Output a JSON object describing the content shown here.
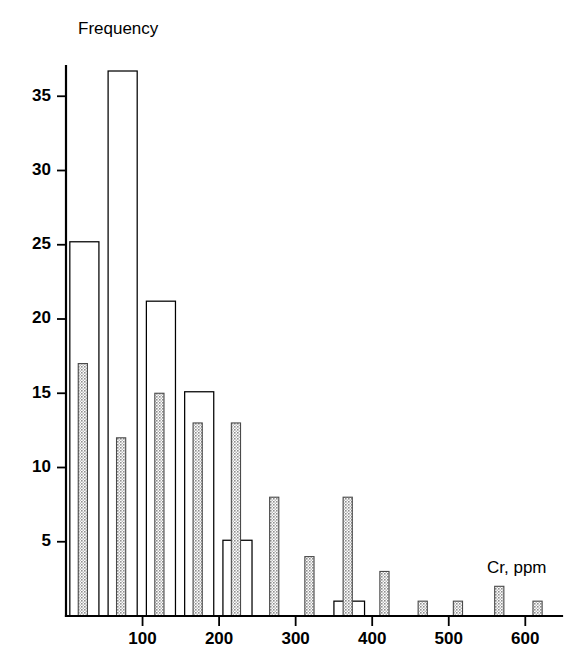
{
  "figure": {
    "background_color": "#ffffff",
    "ylabel": "Frequency",
    "xlabel": "Cr, ppm"
  },
  "chart_data": {
    "type": "bar",
    "title": "",
    "subtitle": "",
    "xlabel": "Cr, ppm",
    "ylabel": "Frequency",
    "xlim": [
      0,
      660
    ],
    "ylim": [
      0,
      38
    ],
    "xticks": [
      100,
      200,
      300,
      400,
      500,
      600
    ],
    "xtick_labels": [
      "100",
      "200",
      "300",
      "400",
      "500",
      "600"
    ],
    "yticks": [
      5,
      10,
      15,
      20,
      25,
      30,
      35
    ],
    "ytick_labels": [
      "5",
      "10",
      "15",
      "20",
      "25",
      "30",
      "35"
    ],
    "grid": false,
    "legend": "none",
    "annotations": [
      "Frequency",
      "Cr, ppm"
    ],
    "series": [
      {
        "name": "open-bars",
        "style": "open",
        "fill_color": "#ffffff",
        "edge_color": "#000000",
        "bin_width": 38,
        "bars": [
          {
            "x_start": 5,
            "x_end": 43,
            "value": 25.2
          },
          {
            "x_start": 55,
            "x_end": 93,
            "value": 36.7
          },
          {
            "x_start": 105,
            "x_end": 143,
            "value": 21.2
          },
          {
            "x_start": 155,
            "x_end": 193,
            "value": 15.1
          },
          {
            "x_start": 205,
            "x_end": 243,
            "value": 5.1
          },
          {
            "x_start": 350,
            "x_end": 368,
            "value": 1.0
          },
          {
            "x_start": 372,
            "x_end": 390,
            "value": 1.0
          }
        ]
      },
      {
        "name": "shaded-bars",
        "style": "shaded",
        "fill_color": "#b3b3b3",
        "edge_color": "#4a4a4a",
        "bar_width": 12,
        "bars": [
          {
            "x_center": 22,
            "value": 17
          },
          {
            "x_center": 72,
            "value": 12
          },
          {
            "x_center": 122,
            "value": 15
          },
          {
            "x_center": 172,
            "value": 13
          },
          {
            "x_center": 222,
            "value": 13
          },
          {
            "x_center": 272,
            "value": 8
          },
          {
            "x_center": 318,
            "value": 4
          },
          {
            "x_center": 368,
            "value": 8
          },
          {
            "x_center": 416,
            "value": 3
          },
          {
            "x_center": 466,
            "value": 1
          },
          {
            "x_center": 512,
            "value": 1
          },
          {
            "x_center": 566,
            "value": 2
          },
          {
            "x_center": 616,
            "value": 1
          }
        ]
      }
    ]
  }
}
